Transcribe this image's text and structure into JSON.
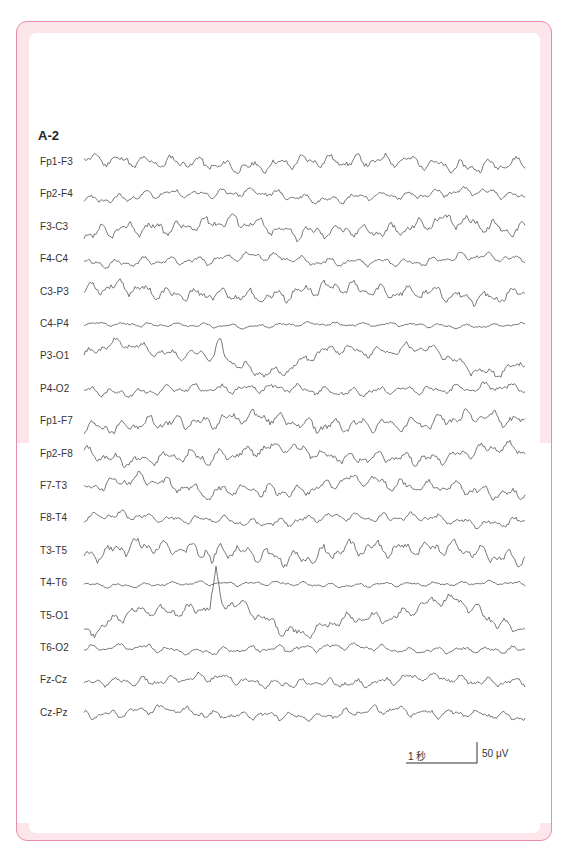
{
  "figure": {
    "label": "A-2",
    "frame_color": "#e98ea2",
    "band_color": "#fce6ec",
    "trace_color": "#555555"
  },
  "channels": [
    {
      "label": "Fp1-F3",
      "amp": 7,
      "seed": 11,
      "drift": 3
    },
    {
      "label": "Fp2-F4",
      "amp": 5,
      "seed": 23,
      "drift": 3
    },
    {
      "label": "F3-C3",
      "amp": 8,
      "seed": 37,
      "drift": 5
    },
    {
      "label": "F4-C4",
      "amp": 5,
      "seed": 41,
      "drift": 3
    },
    {
      "label": "C3-P3",
      "amp": 8,
      "seed": 53,
      "drift": 4
    },
    {
      "label": "C4-P4",
      "amp": 2.5,
      "seed": 67,
      "drift": 1
    },
    {
      "label": "P3-O1",
      "amp": 6,
      "seed": 71,
      "drift": 11,
      "spike_x": 220,
      "spike_h": 16
    },
    {
      "label": "P4-O2",
      "amp": 5,
      "seed": 83,
      "drift": 2
    },
    {
      "label": "Fp1-F7",
      "amp": 8,
      "seed": 97,
      "drift": 4
    },
    {
      "label": "Fp2-F8",
      "amp": 7,
      "seed": 101,
      "drift": 5,
      "spike_x": 208,
      "spike_h": -8
    },
    {
      "label": "F7-T3",
      "amp": 7,
      "seed": 113,
      "drift": 5,
      "spike_x": 210,
      "spike_h": -12
    },
    {
      "label": "F8-T4",
      "amp": 5,
      "seed": 127,
      "drift": 3
    },
    {
      "label": "T3-T5",
      "amp": 9,
      "seed": 131,
      "drift": 5,
      "spike_x": 212,
      "spike_h": -12
    },
    {
      "label": "T4-T6",
      "amp": 2.5,
      "seed": 139,
      "drift": 1
    },
    {
      "label": "T5-O1",
      "amp": 7,
      "seed": 149,
      "drift": 12,
      "spike_x": 216,
      "spike_h": 30
    },
    {
      "label": "T6-O2",
      "amp": 4,
      "seed": 151,
      "drift": 2
    },
    {
      "label": "Fz-Cz",
      "amp": 5,
      "seed": 163,
      "drift": 3
    },
    {
      "label": "Cz-Pz",
      "amp": 5,
      "seed": 173,
      "drift": 3
    }
  ],
  "scale_bar": {
    "time_label": "1 秒",
    "amplitude_label": "50 μV"
  }
}
